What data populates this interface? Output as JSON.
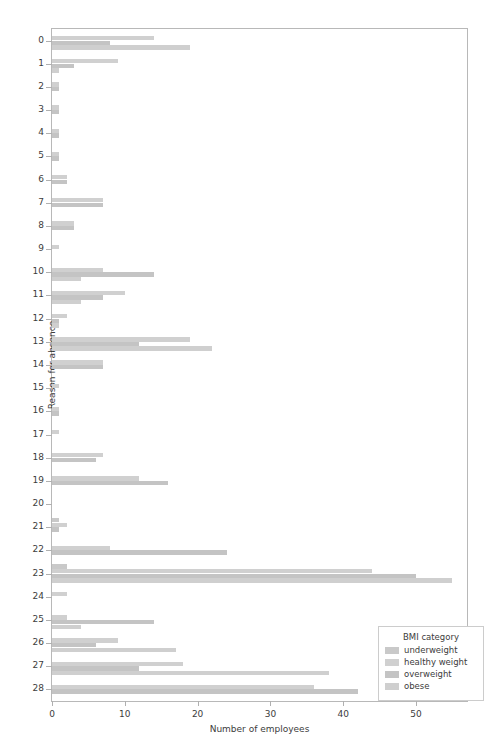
{
  "chart_data": {
    "type": "bar",
    "orientation": "horizontal",
    "title": "",
    "xlabel": "Number of employees",
    "ylabel": "Reason for absence",
    "xlim": [
      0,
      57
    ],
    "xticks": [
      0,
      10,
      20,
      30,
      40,
      50
    ],
    "grid": false,
    "legend": {
      "title": "BMI category",
      "position": "lower right",
      "entries": [
        "underweight",
        "healthy weight",
        "overweight",
        "obese"
      ]
    },
    "colors": {
      "underweight": "#c9c9c9",
      "healthy weight": "#d0d0d0",
      "overweight": "#c4c4c4",
      "obese": "#cfcfcf"
    },
    "categories": [
      "0",
      "1",
      "2",
      "3",
      "4",
      "5",
      "6",
      "7",
      "8",
      "9",
      "10",
      "11",
      "12",
      "13",
      "14",
      "15",
      "16",
      "17",
      "18",
      "19",
      "20",
      "21",
      "22",
      "23",
      "24",
      "25",
      "26",
      "27",
      "28"
    ],
    "series": [
      {
        "name": "underweight",
        "values": [
          0,
          0,
          0,
          0,
          0,
          0,
          0,
          0,
          0,
          0,
          0,
          0,
          0,
          0,
          0,
          0,
          0,
          0,
          0,
          0,
          0,
          1,
          0,
          2,
          0,
          0,
          0,
          0,
          0
        ]
      },
      {
        "name": "healthy weight",
        "values": [
          14,
          9,
          1,
          1,
          1,
          1,
          2,
          7,
          3,
          1,
          7,
          10,
          2,
          19,
          7,
          1,
          1,
          1,
          7,
          12,
          0,
          2,
          8,
          44,
          2,
          2,
          9,
          18,
          36
        ]
      },
      {
        "name": "overweight",
        "values": [
          8,
          3,
          1,
          1,
          1,
          1,
          2,
          7,
          3,
          0,
          14,
          7,
          1,
          12,
          7,
          0,
          1,
          0,
          6,
          16,
          0,
          1,
          24,
          50,
          0,
          14,
          6,
          12,
          42
        ]
      },
      {
        "name": "obese",
        "values": [
          19,
          1,
          0,
          0,
          0,
          0,
          0,
          0,
          0,
          0,
          4,
          4,
          1,
          22,
          0,
          0,
          0,
          0,
          0,
          0,
          0,
          0,
          0,
          55,
          0,
          4,
          17,
          38,
          0
        ]
      }
    ]
  }
}
